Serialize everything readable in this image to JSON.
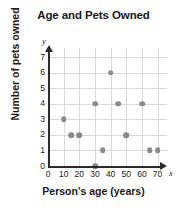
{
  "chart_data": {
    "type": "scatter",
    "title": "Age and Pets Owned",
    "xlabel": "Person's age (years)",
    "ylabel": "Number of pets owned",
    "xlim": [
      0,
      76
    ],
    "ylim": [
      0,
      7.6
    ],
    "grid": true,
    "legend": null,
    "x_axis_variable": "x",
    "y_axis_variable": "y",
    "xticks": [
      0,
      10,
      20,
      30,
      40,
      50,
      60,
      70
    ],
    "yticks": [
      0,
      1,
      2,
      3,
      4,
      5,
      6,
      7
    ],
    "xtick_labels": [
      "0",
      "10",
      "20",
      "30",
      "40",
      "50",
      "60",
      "70"
    ],
    "ytick_labels": [
      "0",
      "1",
      "2",
      "3",
      "4",
      "5",
      "6",
      "7"
    ],
    "point_color": "#8a8a90",
    "grid_color": "#d9d9dd",
    "axis_color": "#2b2b2b",
    "points": [
      {
        "x": 10,
        "y": 3
      },
      {
        "x": 15,
        "y": 2
      },
      {
        "x": 20,
        "y": 2
      },
      {
        "x": 30,
        "y": 0
      },
      {
        "x": 30,
        "y": 4
      },
      {
        "x": 35,
        "y": 1
      },
      {
        "x": 40,
        "y": 6
      },
      {
        "x": 45,
        "y": 4
      },
      {
        "x": 50,
        "y": 2
      },
      {
        "x": 60,
        "y": 4
      },
      {
        "x": 65,
        "y": 1
      },
      {
        "x": 70,
        "y": 1
      }
    ]
  }
}
